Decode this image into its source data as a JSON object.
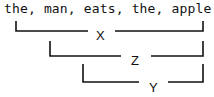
{
  "sentence": "the, man, eats, the, apple",
  "brackets": [
    {
      "label": "X",
      "spans": "the, man, eats, the, apple"
    },
    {
      "label": "Z",
      "spans": "man, eats, the, apple"
    },
    {
      "label": "Y",
      "spans": "eats, the, apple"
    }
  ],
  "colors": {
    "stroke": "#111111",
    "background": "#ffffff"
  }
}
